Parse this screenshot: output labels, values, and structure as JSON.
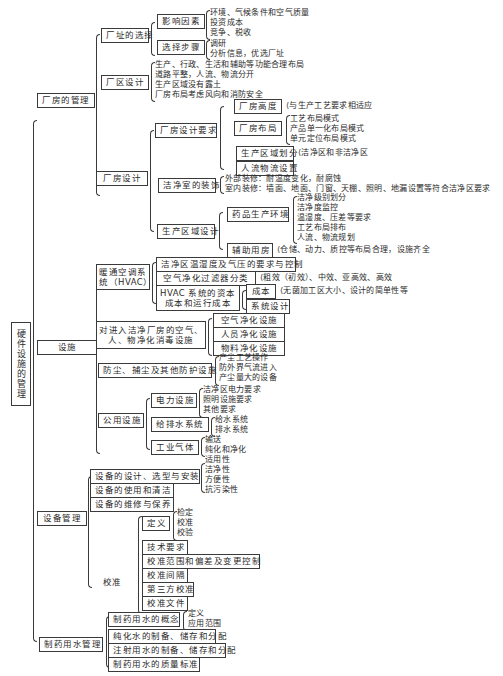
{
  "root": {
    "label": "硬件设施的管理"
  },
  "branches": {
    "plant": {
      "label": "厂房的管理",
      "site": {
        "label": "厂址的选择",
        "factors": {
          "label": "影响因素",
          "items": [
            "环境、气候条件和空气质量",
            "投资成本",
            "竞争、税收"
          ]
        },
        "steps": {
          "label": "选择步骤",
          "items": [
            "调研",
            "分析信息，优选厂址"
          ]
        }
      },
      "zone": {
        "label": "厂区设计",
        "items": [
          "生产、行政、生活和辅助等功能合理布局",
          "道路平整，人流、物流分开",
          "生产区域没有露土",
          "厂房布局考虑风向和消防安全"
        ]
      },
      "design": {
        "label": "厂房设计",
        "req": {
          "label": "厂房设计要求",
          "height": {
            "label": "厂房高度",
            "items": [
              "与生产工艺要求相适应"
            ]
          },
          "layout": {
            "label": "厂房布局",
            "items": [
              "工艺布局模式",
              "产品单一化布局模式",
              "单元定位布局模式"
            ]
          },
          "division": {
            "label": "生产区域划分",
            "items": [
              "洁净区和非洁净区"
            ]
          },
          "flow": {
            "label": "人流物流设置"
          }
        },
        "decor": {
          "label": "洁净室的装饰",
          "items": [
            "外部装修：耐温度变化，耐腐蚀",
            "室内装修：墙面、地面、门窗、天棚、照明、地漏设置等符合洁净区要求"
          ]
        },
        "area": {
          "label": "生产区域设计",
          "env": {
            "label": "药品生产环境",
            "items": [
              "洁净级别划分",
              "洁净度监控",
              "温湿度、压差等要求",
              "工艺布局排布",
              "人流、物流规划"
            ]
          },
          "aux": {
            "label": "辅助用房",
            "items": [
              "仓储、动力、质控等布局合理，设施齐全"
            ]
          }
        }
      }
    },
    "facility": {
      "label": "设施",
      "hvac": {
        "label": "暖通空调系统（HVAC）",
        "label_line1": "暖通空调系",
        "label_line2": "统（HVAC）",
        "temp": {
          "label": "洁净区温湿度及气压的要求与控制"
        },
        "filter": {
          "label": "空气净化过滤器分类",
          "items": [
            "粗效（初效）、中效、亚高效、高效"
          ]
        },
        "cost": {
          "label_line1": "HVAC 系统的资本",
          "label_line2": "成本和运行成本",
          "capital": {
            "label": "成本",
            "items": [
              "无菌加工区大小、设计的简单性等"
            ]
          },
          "sysdesign": {
            "label": "系统设计"
          }
        }
      },
      "purify": {
        "label_line1": "对进入洁净厂房的空气、",
        "label_line2": "人、物净化消毒设施",
        "items": [
          "空气净化设施",
          "人员净化设施",
          "物料净化设施"
        ]
      },
      "dust": {
        "label": "防尘、捕尘及其他防护设施",
        "items": [
          "产尘工艺操作",
          "防外界气流进入",
          "产尘量大的设备"
        ]
      },
      "utility": {
        "label": "公用设施",
        "power": {
          "label": "电力设施",
          "items": [
            "洁净区电力要求",
            "照明设施要求",
            "其他要求"
          ]
        },
        "water": {
          "label": "给排水系统",
          "items": [
            "给水系统",
            "排水系统"
          ]
        },
        "gas": {
          "label": "工业气体",
          "items": [
            "输送",
            "纯化和净化"
          ]
        }
      }
    },
    "equipment": {
      "label": "设备管理",
      "design": {
        "label": "设备的设计、选型与安装",
        "items": [
          "适用性",
          "洁净性",
          "方便性",
          "抗污染性"
        ]
      },
      "use": {
        "label": "设备的使用和清洁"
      },
      "maint": {
        "label": "设备的维修与保养"
      },
      "calib": {
        "label": "校准",
        "def": {
          "label": "定义",
          "items": [
            "检定",
            "校准",
            "校验"
          ]
        },
        "items": [
          "技术要求",
          "校准范围和偏差及变更控制",
          "校准间隔",
          "第三方校准",
          "校准文件"
        ]
      }
    },
    "water": {
      "label": "制药用水管理",
      "concept": {
        "label": "制药用水的概念",
        "items": [
          "定义",
          "应用范围"
        ]
      },
      "items": [
        "纯化水的制备、储存和分配",
        "注射用水的制备、储存和分配",
        "制药用水的质量标准"
      ]
    }
  }
}
